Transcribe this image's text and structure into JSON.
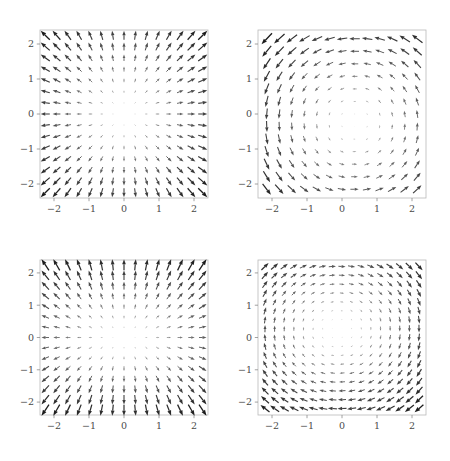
{
  "figure": {
    "background_color": "#ffffff",
    "width": 450,
    "height": 461,
    "layout": "2x2 grid of quiver (vector field) plots",
    "arrow_color": "#1b1b1b",
    "frame_color": "#b9b9b9",
    "tick_label_color": "#4a4a4a"
  },
  "axes": {
    "x_ticks": [
      "−2",
      "−1",
      "0",
      "1",
      "2"
    ],
    "y_ticks": [
      "2",
      "1",
      "0",
      "−1",
      "−2"
    ],
    "x_tick_values": [
      -2,
      -1,
      0,
      1,
      2
    ],
    "y_tick_values": [
      2,
      1,
      0,
      -1,
      -2
    ],
    "xlim": [
      -2.4,
      2.4
    ],
    "ylim": [
      -2.4,
      2.4
    ],
    "xlabel": "",
    "ylabel": "",
    "grid": false
  },
  "chart_data": [
    {
      "id": "panel-top-left",
      "type": "quiver",
      "position": "top-left",
      "title": "",
      "xlabel": "",
      "ylabel": "",
      "xlim": [
        -2.4,
        2.4
      ],
      "ylim": [
        -2.4,
        2.4
      ],
      "xticks": [
        -2,
        -1,
        0,
        1,
        2
      ],
      "yticks": [
        -2,
        -1,
        0,
        1,
        2
      ],
      "xticklabels": [
        "−2",
        "−1",
        "0",
        "1",
        "2"
      ],
      "yticklabels": [
        "−2",
        "−1",
        "0",
        "1",
        "2"
      ],
      "grid": false,
      "legend": null,
      "field": {
        "description": "Radial outward source field: arrows point away from the origin, magnitude grows with radius",
        "u_expression": "x",
        "v_expression": "y",
        "grid_nx": 15,
        "grid_ny": 15,
        "sample_range": [
          -2.25,
          2.25
        ],
        "scale": 0.115
      }
    },
    {
      "id": "panel-top-right",
      "type": "quiver",
      "position": "top-right",
      "title": "",
      "xlabel": "",
      "ylabel": "",
      "xlim": [
        -2.4,
        2.4
      ],
      "ylim": [
        -2.4,
        2.4
      ],
      "xticks": [
        -2,
        -1,
        0,
        1,
        2
      ],
      "yticks": [
        -2,
        -1,
        0,
        1,
        2
      ],
      "xticklabels": [
        "−2",
        "−1",
        "0",
        "1",
        "2"
      ],
      "yticklabels": [
        "−2",
        "−1",
        "0",
        "1",
        "2"
      ],
      "grid": false,
      "legend": null,
      "field": {
        "description": "Rotational vortex field with a saddle-like offset: arrows sweep counter-clockwise, strongest near the corners",
        "u_expression": "-y",
        "v_expression": "x",
        "grid_nx": 13,
        "grid_ny": 13,
        "sample_range": [
          -2.15,
          2.15
        ],
        "scale": 0.125,
        "offset_x": 0.35,
        "offset_y": -0.25
      }
    },
    {
      "id": "panel-bottom-left",
      "type": "quiver",
      "position": "bottom-left",
      "title": "",
      "xlabel": "",
      "ylabel": "",
      "xlim": [
        -2.4,
        2.4
      ],
      "ylim": [
        -2.4,
        2.4
      ],
      "xticks": [
        -2,
        -1,
        0,
        1,
        2
      ],
      "yticks": [
        -2,
        -1,
        0,
        1,
        2
      ],
      "xticklabels": [
        "−2",
        "−1",
        "0",
        "1",
        "2"
      ],
      "yticklabels": [
        "−2",
        "−1",
        "0",
        "1",
        "2"
      ],
      "grid": false,
      "legend": null,
      "field": {
        "description": "Outward source field with stretched vertical component: arrows diverge from the origin, vertical flow dominant near the x axis",
        "u_expression": "x",
        "v_expression": "1.6*y",
        "grid_nx": 15,
        "grid_ny": 15,
        "sample_range": [
          -2.25,
          2.25
        ],
        "scale": 0.095
      }
    },
    {
      "id": "panel-bottom-right",
      "type": "quiver",
      "position": "bottom-right",
      "title": "",
      "xlabel": "",
      "ylabel": "",
      "xlim": [
        -2.4,
        2.4
      ],
      "ylim": [
        -2.4,
        2.4
      ],
      "xticks": [
        -2,
        -1,
        0,
        1,
        2
      ],
      "yticks": [
        -2,
        -1,
        0,
        1,
        2
      ],
      "xticklabels": [
        "−2",
        "−1",
        "0",
        "1",
        "2"
      ],
      "yticklabels": [
        "−2",
        "−1",
        "0",
        "1",
        "2"
      ],
      "grid": false,
      "legend": null,
      "field": {
        "description": "Clockwise rotational vortex: arrows circulate about the origin on nested closed orbits, magnitude grows with radius",
        "u_expression": "y",
        "v_expression": "-x",
        "grid_nx": 17,
        "grid_ny": 17,
        "sample_range": [
          -2.2,
          2.2
        ],
        "scale": 0.105,
        "offset_x": -0.1,
        "offset_y": 0.25
      }
    }
  ],
  "panel_geometry": [
    {
      "id": "panel-top-left",
      "left": 40,
      "top": 28,
      "width": 168,
      "height": 168
    },
    {
      "id": "panel-top-right",
      "left": 258,
      "top": 28,
      "width": 168,
      "height": 168
    },
    {
      "id": "panel-bottom-left",
      "left": 40,
      "top": 258,
      "width": 168,
      "height": 155
    },
    {
      "id": "panel-bottom-right",
      "left": 258,
      "top": 258,
      "width": 168,
      "height": 155
    }
  ]
}
